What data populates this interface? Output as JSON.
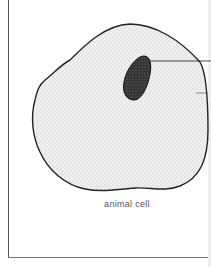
{
  "figure": {
    "caption": "animal cell",
    "parts": [
      {
        "name": "cell-membrane",
        "description": "irregular outer boundary"
      },
      {
        "name": "cytoplasm",
        "description": "lightly stippled interior"
      },
      {
        "name": "nucleus",
        "description": "dark stippled oval"
      }
    ],
    "label_lines": 2,
    "colors": {
      "outline": "#222222",
      "cytoplasm": "#e6e6e6",
      "nucleus": "#3a3a3a",
      "frame": "#555555",
      "background": "#ffffff"
    }
  }
}
